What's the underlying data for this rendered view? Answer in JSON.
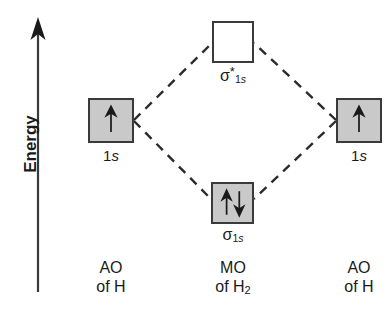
{
  "axis": {
    "label": "Energy",
    "direction": "up",
    "arrow_icon": "up-arrow-icon"
  },
  "orbitals": [
    {
      "id": "ao-left",
      "label": "1s",
      "label_prefix": "1",
      "label_italic": "s",
      "fill": "gray",
      "fill_color": "#c9c9c9",
      "border_color": "#3a3a3a",
      "electrons": [
        "up"
      ],
      "electron_count": 1
    },
    {
      "id": "mo-antibonding",
      "label": "σ*1s",
      "label_sigma": "σ",
      "label_star": "*",
      "label_sub_prefix": "1",
      "label_sub_italic": "s",
      "fill": "white",
      "fill_color": "#ffffff",
      "border_color": "#3a3a3a",
      "electrons": [],
      "electron_count": 0
    },
    {
      "id": "mo-bonding",
      "label": "σ1s",
      "label_sigma": "σ",
      "label_sub_prefix": "1",
      "label_sub_italic": "s",
      "fill": "gray",
      "fill_color": "#c9c9c9",
      "border_color": "#3a3a3a",
      "electrons": [
        "up",
        "down"
      ],
      "electron_count": 2
    },
    {
      "id": "ao-right",
      "label": "1s",
      "label_prefix": "1",
      "label_italic": "s",
      "fill": "gray",
      "fill_color": "#c9c9c9",
      "border_color": "#3a3a3a",
      "electrons": [
        "up"
      ],
      "electron_count": 1
    }
  ],
  "captions": {
    "left": {
      "line1": "AO",
      "line2_prefix": "of H",
      "line2_sub": ""
    },
    "center": {
      "line1": "MO",
      "line2_prefix": "of H",
      "line2_sub": "2"
    },
    "right": {
      "line1": "AO",
      "line2_prefix": "of H",
      "line2_sub": ""
    }
  },
  "connectors": {
    "style": "dashed",
    "color": "#2b2b2b",
    "links": [
      "ao-left -> mo-antibonding",
      "ao-left -> mo-bonding",
      "ao-right -> mo-antibonding",
      "ao-right -> mo-bonding"
    ]
  }
}
